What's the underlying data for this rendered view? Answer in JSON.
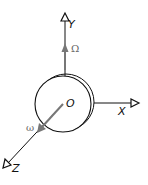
{
  "diagram": {
    "type": "rotating-disc-coordinate-frame",
    "labels": {
      "x_axis": "X",
      "y_axis": "Y",
      "z_axis": "Z",
      "origin": "O",
      "precession_rate": "Ω",
      "spin_rate": "ω"
    },
    "colors": {
      "axis": "#111111",
      "vector": "#777777",
      "background": "#ffffff"
    }
  }
}
